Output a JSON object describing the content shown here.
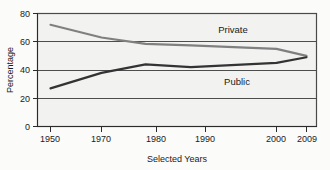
{
  "chart_data": {
    "type": "line",
    "title": "",
    "xlabel": "Selected Years",
    "ylabel": "Percentage",
    "grid": true,
    "legend_position": "inline-annotation",
    "xlim": [
      1950,
      2009
    ],
    "ylim": [
      0,
      80
    ],
    "x_tick_labels": [
      "1950",
      "1970",
      "1980",
      "1990",
      "2000",
      "2009"
    ],
    "x_ticks": [
      1950,
      1970,
      1980,
      1990,
      2000,
      2009
    ],
    "y_tick_labels": [
      "0",
      "20",
      "40",
      "60",
      "80"
    ],
    "y_ticks": [
      0,
      20,
      40,
      60,
      80
    ],
    "series": [
      {
        "name": "Private",
        "color": "#808080",
        "x": [
          1950,
          1970,
          1978,
          1987,
          2000,
          2009
        ],
        "values": [
          72,
          63,
          58.5,
          57.5,
          55,
          50
        ]
      },
      {
        "name": "Public",
        "color": "#333333",
        "x": [
          1950,
          1970,
          1978,
          1987,
          2000,
          2009
        ],
        "values": [
          27,
          38,
          44,
          42,
          45,
          49
        ]
      }
    ],
    "annotations": [
      {
        "text": "Private",
        "x": 1991,
        "y": 67
      },
      {
        "text": "Public",
        "x": 1992,
        "y": 34
      }
    ]
  },
  "axes": {
    "y_title": "Percentage",
    "x_title": "Selected Years",
    "y_labels": [
      "80",
      "60",
      "40",
      "20",
      "0"
    ],
    "x_labels": [
      "1950",
      "1970",
      "1980",
      "1990",
      "2000",
      "2009"
    ]
  },
  "labels": {
    "private": "Private",
    "public": "Public"
  },
  "colors": {
    "private_line": "#808080",
    "public_line": "#333333",
    "plot_background": "#f2f2f0",
    "grid": "#4d4d4d",
    "axis": "#2b2b2b"
  }
}
